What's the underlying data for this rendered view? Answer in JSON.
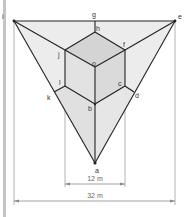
{
  "figure": {
    "type": "perspective-projection-diagram",
    "points": {
      "a": "a",
      "b": "b",
      "c": "c",
      "d": "d",
      "e": "e",
      "f": "f",
      "g": "g",
      "h": "h",
      "i": "i",
      "j": "j",
      "k": "k",
      "l": "l",
      "o": "o"
    },
    "dimensions": {
      "inner": "12 m",
      "outer": "32 m"
    },
    "colors": {
      "outer_fill": "#ececec",
      "cube_top": "#d6d6d6",
      "cube_side": "#e4e4e4",
      "stroke": "#222222",
      "guide": "#9a9a9a",
      "sidebar": "#bdbdbd"
    }
  }
}
